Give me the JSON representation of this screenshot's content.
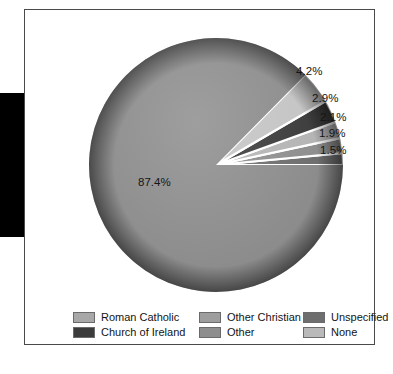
{
  "chart_data": {
    "type": "pie",
    "title": "",
    "subtitle": "",
    "xlabel": "",
    "ylabel": "",
    "legend_position": "bottom",
    "grid": false,
    "unit": "%",
    "categories": [
      "Roman Catholic",
      "None",
      "Church of Ireland",
      "Other Christian",
      "Other",
      "Unspecified"
    ],
    "values": [
      87.4,
      4.2,
      2.9,
      2.1,
      1.9,
      1.5
    ],
    "value_labels": [
      "87.4%",
      "4.2%",
      "2.9%",
      "2.1%",
      "1.9%",
      "1.5%"
    ],
    "colors": [
      "#8c8c8c",
      "#c4c4c4",
      "#3b3b3b",
      "#b4b4b4",
      "#8e8e8e",
      "#6e6e6e"
    ],
    "slices": [
      {
        "name": "Roman Catholic",
        "value": 87.4,
        "label": "87.4%",
        "color": "#8c8c8c"
      },
      {
        "name": "None",
        "value": 4.2,
        "label": "4.2%",
        "color": "#c4c4c4"
      },
      {
        "name": "Church of Ireland",
        "value": 2.9,
        "label": "2.9%",
        "color": "#3b3b3b"
      },
      {
        "name": "Other Christian",
        "value": 2.1,
        "label": "2.1%",
        "color": "#b4b4b4"
      },
      {
        "name": "Other",
        "value": 1.9,
        "label": "1.9%",
        "color": "#8e8e8e"
      },
      {
        "name": "Unspecified",
        "value": 1.5,
        "label": "1.5%",
        "color": "#6e6e6e"
      }
    ]
  },
  "labels": {
    "main": "87.4%",
    "callouts": [
      "4.2%",
      "2.9%",
      "2.1%",
      "1.9%",
      "1.5%"
    ]
  },
  "legend": {
    "items": [
      {
        "label": "Roman Catholic",
        "color": "#a8a8a8"
      },
      {
        "label": "Church of Ireland",
        "color": "#3b3b3b"
      },
      {
        "label": "Other Christian",
        "color": "#9d9d9d"
      },
      {
        "label": "Other",
        "color": "#8e8e8e"
      },
      {
        "label": "Unspecified",
        "color": "#6e6e6e"
      },
      {
        "label": "None",
        "color": "#b9b9b9"
      }
    ]
  },
  "colors": {
    "frame_border": "#4a4a4a",
    "background": "#ffffff",
    "left_bar": "#000000",
    "text": "#141414",
    "slice_divider": "#ffffff"
  }
}
